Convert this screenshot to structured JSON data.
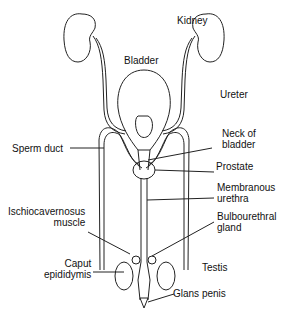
{
  "diagram": {
    "type": "anatomical illustration",
    "labels": {
      "kidney": "Kidney",
      "bladder": "Bladder",
      "ureter": "Ureter",
      "neck_of_bladder_1": "Neck of",
      "neck_of_bladder_2": "bladder",
      "sperm_duct": "Sperm duct",
      "prostate": "Prostate",
      "membranous_urethra_1": "Membranous",
      "membranous_urethra_2": "urethra",
      "ischiocavernosus_1": "Ischiocavernosus",
      "ischiocavernosus_2": "muscle",
      "bulbourethral_1": "Bulbourethral",
      "bulbourethral_2": "gland",
      "caput_epididymis_1": "Caput",
      "caput_epididymis_2": "epididymis",
      "testis": "Testis",
      "glans_penis": "Glans penis"
    },
    "colors": {
      "line": "#222222",
      "background": "#ffffff"
    }
  }
}
